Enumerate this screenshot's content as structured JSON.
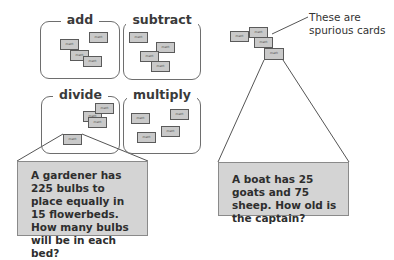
{
  "groups": [
    {
      "id": "add",
      "label": "add"
    },
    {
      "id": "subtract",
      "label": "subtract"
    },
    {
      "id": "divide",
      "label": "divide"
    },
    {
      "id": "multiply",
      "label": "multiply"
    }
  ],
  "card_label": "math",
  "problems": {
    "left": "A gardener has 225 bulbs to place equally in 15 flowerbeds. How many bulbs will be in each bed?",
    "right": "A boat has 25 goats and 75 sheep. How old is the captain?"
  },
  "annotation": {
    "line1": "These are",
    "line2": "spurious cards"
  },
  "colors": {
    "card_fill": "#c9c9c9",
    "problem_fill": "#d4d4d4",
    "border": "#6e6e6e"
  }
}
